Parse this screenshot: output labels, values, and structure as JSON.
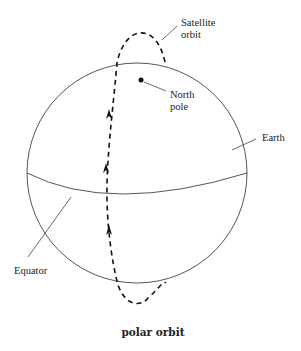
{
  "diagram": {
    "caption": "polar orbit",
    "labels": {
      "satellite_line1": "Satellite",
      "satellite_line2": "orbit",
      "north_line1": "North",
      "north_line2": "pole",
      "earth": "Earth",
      "equator": "Equator"
    },
    "colors": {
      "stroke": "#444444",
      "orbit": "#111111",
      "background": "#ffffff"
    }
  }
}
